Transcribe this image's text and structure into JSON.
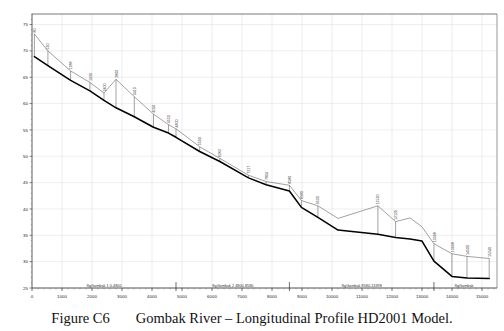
{
  "figure": {
    "caption_number": "Figure C6",
    "caption_text": "Gombak River – Longitudinal Profile HD2001 Model."
  },
  "chart_data": {
    "type": "line",
    "title": "",
    "xlabel": "",
    "ylabel": "",
    "xlim": [
      0,
      15500
    ],
    "ylim": [
      25,
      77
    ],
    "xticks": [
      0,
      1000,
      2000,
      3000,
      4000,
      5000,
      6000,
      7000,
      8000,
      9000,
      10000,
      11000,
      12000,
      13000,
      14000,
      15000
    ],
    "xticklabels": [
      "0",
      "1000",
      "2000",
      "3000",
      "4000",
      "5000",
      "6000",
      "7000",
      "8000",
      "9000",
      "10000",
      "11000",
      "12000",
      "13000",
      "14000",
      "15000"
    ],
    "yticks": [
      25,
      30,
      35,
      40,
      45,
      50,
      55,
      60,
      65,
      70,
      75
    ],
    "yticklabels": [
      "25",
      "30",
      "35",
      "40",
      "45",
      "50",
      "55",
      "60",
      "65",
      "70",
      "75"
    ],
    "grid": true,
    "legend": "none",
    "series": [
      {
        "name": "Water Level Profile",
        "color": "#555555",
        "width": 0.55,
        "x": [
          80,
          530,
          1288,
          1930,
          2400,
          2800,
          3410,
          4050,
          4550,
          4800,
          5590,
          6262,
          7217,
          7804,
          8580,
          8980,
          9530,
          10200,
          11530,
          12120,
          12600,
          13000,
          13398,
          13998,
          14500,
          15240
        ],
        "y": [
          73.2,
          70.0,
          66.2,
          64.0,
          62.0,
          64.6,
          61.3,
          58.0,
          56.0,
          55.2,
          51.8,
          49.6,
          46.4,
          45.2,
          44.5,
          41.6,
          40.6,
          38.2,
          40.6,
          37.6,
          38.3,
          36.6,
          33.4,
          31.5,
          31.0,
          30.6
        ]
      },
      {
        "name": "Bed Level Profile",
        "color": "#000000",
        "width": 1.55,
        "x": [
          80,
          530,
          1288,
          1930,
          2400,
          2800,
          3410,
          4050,
          4550,
          4800,
          5590,
          6262,
          7217,
          7804,
          8580,
          8980,
          9530,
          10200,
          11530,
          12120,
          12600,
          13000,
          13398,
          13998,
          14500,
          15240
        ],
        "y": [
          68.9,
          67.2,
          64.4,
          62.4,
          60.6,
          59.2,
          57.5,
          55.5,
          54.4,
          53.6,
          50.9,
          49.0,
          45.9,
          44.6,
          43.4,
          40.3,
          38.4,
          36.0,
          35.2,
          34.6,
          34.3,
          33.9,
          30.1,
          27.2,
          26.9,
          26.8
        ]
      }
    ],
    "cross_sections": [
      {
        "label": "80",
        "x": 80,
        "top": 73.2,
        "bottom": 68.9
      },
      {
        "label": "530",
        "x": 530,
        "top": 70.0,
        "bottom": 67.2
      },
      {
        "label": "1288",
        "x": 1288,
        "top": 66.2,
        "bottom": 64.4
      },
      {
        "label": "1930",
        "x": 1930,
        "top": 64.0,
        "bottom": 62.4
      },
      {
        "label": "2400",
        "x": 2400,
        "top": 62.0,
        "bottom": 60.6
      },
      {
        "label": "2800",
        "x": 2800,
        "top": 64.6,
        "bottom": 59.2
      },
      {
        "label": "3410",
        "x": 3410,
        "top": 61.3,
        "bottom": 57.5
      },
      {
        "label": "4050",
        "x": 4050,
        "top": 58.0,
        "bottom": 55.5
      },
      {
        "label": "4550",
        "x": 4550,
        "top": 56.0,
        "bottom": 54.4
      },
      {
        "label": "4800",
        "x": 4800,
        "top": 55.2,
        "bottom": 53.6
      },
      {
        "label": "5590",
        "x": 5590,
        "top": 51.8,
        "bottom": 50.9
      },
      {
        "label": "6262",
        "x": 6262,
        "top": 49.6,
        "bottom": 49.0
      },
      {
        "label": "7217",
        "x": 7217,
        "top": 46.4,
        "bottom": 45.9
      },
      {
        "label": "7804",
        "x": 7804,
        "top": 45.2,
        "bottom": 44.6
      },
      {
        "label": "8580",
        "x": 8580,
        "top": 44.5,
        "bottom": 43.4
      },
      {
        "label": "8980",
        "x": 8980,
        "top": 41.6,
        "bottom": 40.3
      },
      {
        "label": "9530",
        "x": 9530,
        "top": 40.6,
        "bottom": 38.4
      },
      {
        "label": "11530",
        "x": 11530,
        "top": 40.6,
        "bottom": 35.2
      },
      {
        "label": "12120",
        "x": 12120,
        "top": 37.6,
        "bottom": 34.6
      },
      {
        "label": "13398",
        "x": 13398,
        "top": 33.4,
        "bottom": 30.1
      },
      {
        "label": "13998",
        "x": 13998,
        "top": 31.5,
        "bottom": 27.2
      },
      {
        "label": "14500",
        "x": 14500,
        "top": 31.0,
        "bottom": 26.9
      },
      {
        "label": "15240",
        "x": 15240,
        "top": 30.6,
        "bottom": 26.8
      }
    ],
    "reaches": [
      {
        "label": "SgGombak 1 0-4800",
        "x_start": 0,
        "x_end": 4800
      },
      {
        "label": "SgGombak 2 4800-8580",
        "x_start": 4800,
        "x_end": 8580
      },
      {
        "label": "SgGombak 8580-13398",
        "x_start": 8580,
        "x_end": 13398
      },
      {
        "label": "SgGombak",
        "x_start": 13398,
        "x_end": 15400
      }
    ]
  }
}
